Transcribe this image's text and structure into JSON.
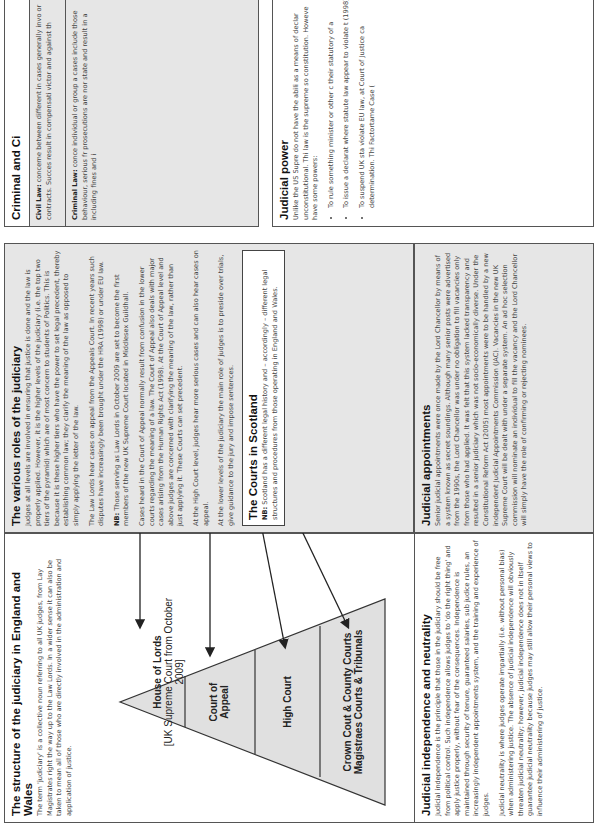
{
  "structure": {
    "title": "The structure of the judiciary in England and Wales",
    "body": "The term 'judiciary' is a collective noun referring to all UK judges, from Lay Magistrates right the way up to the Law Lords. In a wider sense it can also be taken to mean all of those who are directly involved in the administration and application of justice."
  },
  "pyramid": {
    "tiers": [
      {
        "label": "House of Lords",
        "sublabel": "[UK Supreme Court from October 2009]"
      },
      {
        "label": "Court of Appeal"
      },
      {
        "label": "High Court"
      },
      {
        "label": "Crown Cout & County Courts",
        "label2": "Magistraes Courts & Tribunals"
      }
    ],
    "fill": "#e0e0e0"
  },
  "independence": {
    "title": "Judicial independence and neutrality",
    "p1": "Judicial independence is the principle that those in the judiciary should be free from political control. Such independence allows judges to 'do the right thing' and apply justice properly, without fear of the consequences. Independence is maintained through security of tenure, guaranteed salaries, sub judice rules, an increasingly independent appointments system, and the training and experience of judges.",
    "p2": "Judicial neutrality is where judges operate impartially (i.e. without personal bias) when administering justice. The absence of judicial independence will obviously threaten judicial neutrality; however, judicial independence does not in itself guarantee judicial neutrality because judges may still allow their personal views to influence their administering of justice."
  },
  "roles": {
    "title": "The various roles of the judiciary",
    "p1": "Judges at all levels are involved in ensuring that justice is done and the law is properly applied. However, it is the higher levels of the judiciary (i.e. the top two tiers of the pyramid) which are of most concern to students of Politics. This is because it is these higher tiers who have the power to set legal precedent, thereby establishing common law; they clarify the meaning of the law as opposed to simply applying the letter of the law.",
    "p2": "The Law Lords hear cases on appeal from the Appeals Court. In recent years such disputes have increasingly been brought under the HRA (1998) or under EU law.",
    "p3_nb": "NB:",
    "p3": " Those serving as Law Lords in October 2009 are set to become the first members of the new UK Supreme Court located in Middlesex Guildhall.",
    "p4": "Cases heard in the Court of Appeal normally result from confusion in the lower courts regarding the meaning of a law. The Court of Appeal also deals with major cases arising from the Human Rights Act (1998). At the Court of Appeal level and above judges are concerned with clarifying the meaning of the law, rather than just applying it. These Courts can set precedent.",
    "p5": "At the High Court level, judges hear more serious cases and can also hear cases on appeal.",
    "p6": "At the lower levels of the judiciary the main role of judges is to preside over trials, give guidance to the jury and impose sentences."
  },
  "scotland": {
    "title": "The Courts in Scotland",
    "nb": "NB:",
    "body": " Scotland has a different legal history and – accordingly – different legal structures and procedures from those operating in England and Wales."
  },
  "appointments": {
    "title": "Judicial appointments",
    "body": "Senior judicial appointments were once made by the Lord Chancellor by means of a system known as secret soundings. Although many senior posts were advertised from the 1990s, the Lord Chancellor was under no obligation to fill vacancies only from those who had applied. It was felt that this system lacked transparency and resulted in a senior judiciary which was not socio-economically diverse. Under the Constitutional Reform Act (2005) most appointments were to be handled by a new independent Judicial Appointments Commission (JAC). Vacancies in the new UK Supreme Court will be dealt with under a separate system. An ad hoc selection commission will nominate an individual to fill the vacancy and the Lord Chancellor will simply have the role of confirming or rejecting nominees."
  },
  "civil_criminal": {
    "title": "Criminal and Ci",
    "civil_label": "Civil Law:",
    "civil": " concerne between different in cases generally invo or contracts. Succes result in compensati victor and against th",
    "criminal_label": "Criminal Law:",
    "criminal": " conce individual or group a cases include those behaviour, serious fr prosecutions are nor state and result in a including fines and i"
  },
  "power": {
    "title": "Judicial power",
    "body": "Unlike the US Supre do not have the abili as a means of declar unconstitutional. Thi law is the supreme so constitution. Howeve have some powers:",
    "bullets": [
      "To rule something minister or other c their statutory of a",
      "To issue a declarat where statute law appear to violate t (1998).",
      "To suspend UK sta violate EU law, at Court of Justice ca determination. Thi Factortame Case ("
    ]
  }
}
